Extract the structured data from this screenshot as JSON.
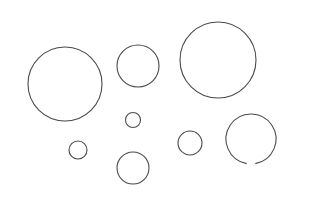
{
  "canvas": {
    "width": 320,
    "height": 211,
    "background": "#ffffff",
    "stroke_color": "#4a4a4a",
    "stroke_width": 1.1
  },
  "circles": [
    {
      "name": "circle-large-left",
      "cx": 65,
      "cy": 84,
      "r": 37,
      "gap": null
    },
    {
      "name": "circle-medium-top",
      "cx": 138,
      "cy": 66,
      "r": 21,
      "gap": null
    },
    {
      "name": "circle-large-right",
      "cx": 218,
      "cy": 60,
      "r": 38,
      "gap": null
    },
    {
      "name": "circle-tiny-center",
      "cx": 133,
      "cy": 120,
      "r": 7.5,
      "gap": null
    },
    {
      "name": "circle-small-left",
      "cx": 78,
      "cy": 150,
      "r": 9,
      "gap": null
    },
    {
      "name": "circle-small-bottom",
      "cx": 133,
      "cy": 168,
      "r": 16,
      "gap": null
    },
    {
      "name": "circle-small-right",
      "cx": 190,
      "cy": 143,
      "r": 12,
      "gap": null
    },
    {
      "name": "circle-broken-right",
      "cx": 251,
      "cy": 139,
      "r": 25,
      "gap": {
        "start_deg": 80,
        "end_deg": 100
      }
    }
  ]
}
